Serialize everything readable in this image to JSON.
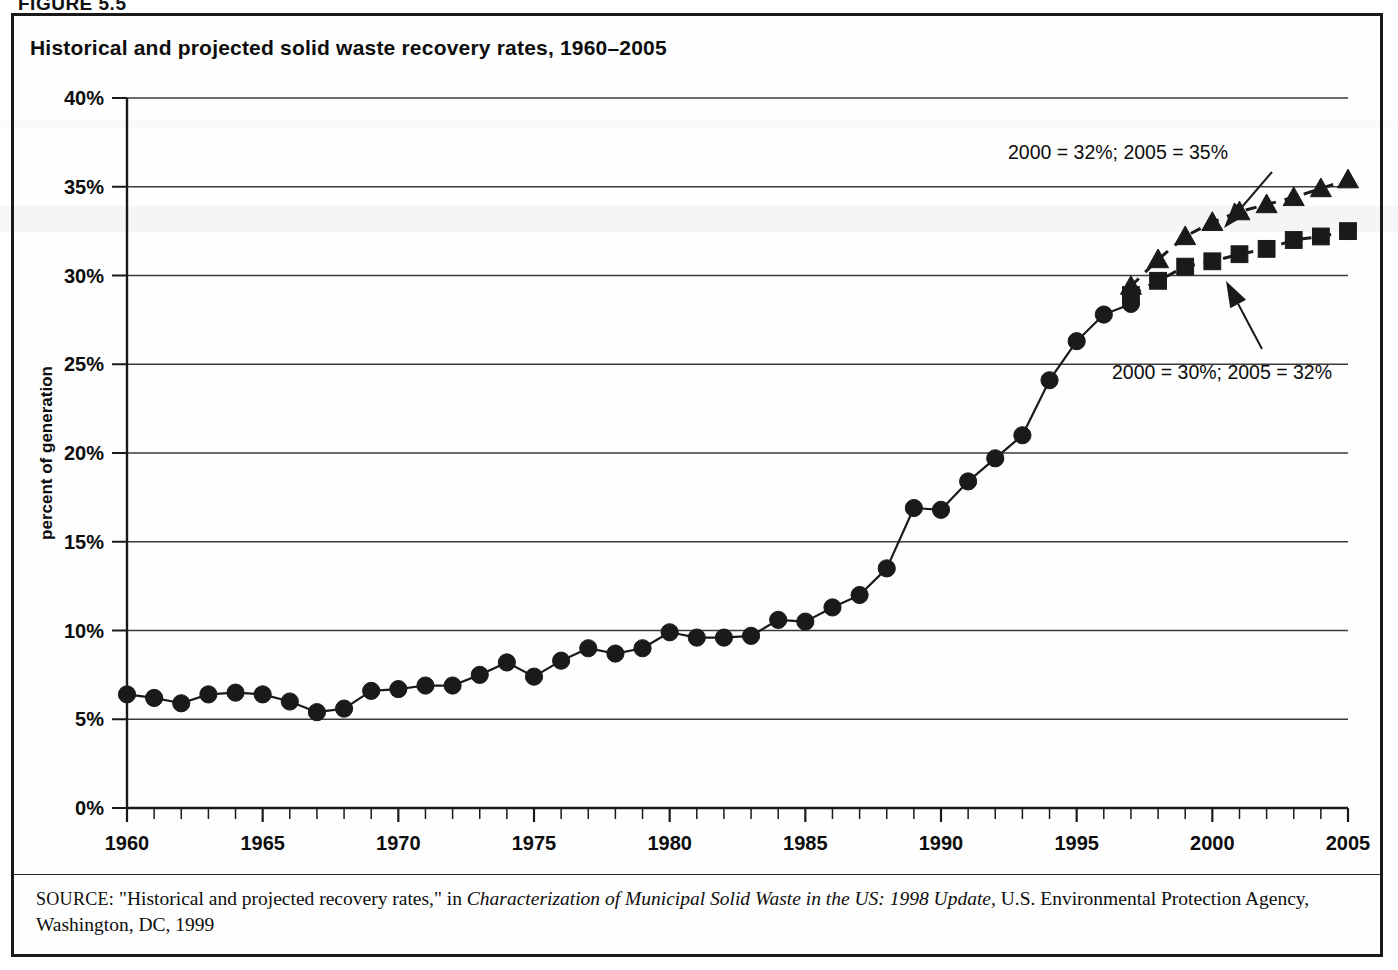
{
  "figure": {
    "label": "FIGURE 5.5",
    "title": "Historical and projected solid waste recovery rates, 1960–2005"
  },
  "source": {
    "kicker": "SOURCE:",
    "text_before_italic": " \"Historical and projected recovery rates,\" in ",
    "italic_title": "Characterization of Municipal Solid Waste in the US: 1998 Update,",
    "text_after_italic": " U.S. Environmental Protection Agency, Washington, DC, 1999"
  },
  "annotations": [
    {
      "name": "projection-high-label",
      "text": "2000 = 32%; 2005 = 35%",
      "x": 1118,
      "y": 159
    },
    {
      "name": "projection-low-label",
      "text": "2000 = 30%; 2005 = 32%",
      "x": 1222,
      "y": 379
    }
  ],
  "chart_data": {
    "type": "line",
    "title": "Historical and projected solid waste recovery rates, 1960–2005",
    "xlabel": "",
    "ylabel": "percent of generation",
    "xlim": [
      1960,
      2005
    ],
    "ylim": [
      0,
      40
    ],
    "ytick_values": [
      0,
      5,
      10,
      15,
      20,
      25,
      30,
      35,
      40
    ],
    "ytick_labels": [
      "0%",
      "5%",
      "10%",
      "15%",
      "20%",
      "25%",
      "30%",
      "35%",
      "40%"
    ],
    "xtick_values": [
      1960,
      1965,
      1970,
      1975,
      1980,
      1985,
      1990,
      1995,
      2000,
      2005
    ],
    "xtick_labels": [
      "1960",
      "1965",
      "1970",
      "1975",
      "1980",
      "1985",
      "1990",
      "1995",
      "2000",
      "2005"
    ],
    "x_minor_tick_step": 1,
    "grid": "horizontal",
    "legend_position": "none",
    "series": [
      {
        "name": "Historical recovery rate",
        "marker": "circle",
        "linestyle": "solid",
        "color": "#1a1a1a",
        "x": [
          1960,
          1961,
          1962,
          1963,
          1964,
          1965,
          1966,
          1967,
          1968,
          1969,
          1970,
          1971,
          1972,
          1973,
          1974,
          1975,
          1976,
          1977,
          1978,
          1979,
          1980,
          1981,
          1982,
          1983,
          1984,
          1985,
          1986,
          1987,
          1988,
          1989,
          1990,
          1991,
          1992,
          1993,
          1994,
          1995,
          1996,
          1997
        ],
        "values": [
          6.4,
          6.2,
          5.9,
          6.4,
          6.5,
          6.4,
          6.0,
          5.4,
          5.6,
          6.6,
          6.7,
          6.9,
          6.9,
          7.5,
          8.2,
          7.4,
          8.3,
          9.0,
          8.7,
          9.0,
          9.9,
          9.6,
          9.6,
          9.7,
          10.6,
          10.5,
          11.3,
          12.0,
          13.5,
          16.9,
          16.8,
          18.4,
          19.7,
          21.0,
          24.1,
          26.3,
          27.8,
          28.4
        ]
      },
      {
        "name": "Projected high scenario",
        "marker": "triangle",
        "linestyle": "dashed",
        "color": "#1a1a1a",
        "x": [
          1997,
          1998,
          1999,
          2000,
          2001,
          2002,
          2003,
          2004,
          2005
        ],
        "values": [
          29.4,
          30.9,
          32.2,
          33.0,
          33.6,
          34.0,
          34.4,
          34.9,
          35.4
        ]
      },
      {
        "name": "Projected low scenario",
        "marker": "square",
        "linestyle": "dashed",
        "color": "#1a1a1a",
        "x": [
          1997,
          1998,
          1999,
          2000,
          2001,
          2002,
          2003,
          2004,
          2005
        ],
        "values": [
          28.9,
          29.7,
          30.5,
          30.8,
          31.2,
          31.5,
          32.0,
          32.2,
          32.5
        ]
      }
    ],
    "annotation_points": [
      {
        "label": "2000 = 32%; 2005 = 35%",
        "target_x": 2001,
        "target_y": 33.2
      },
      {
        "label": "2000 = 30%; 2005 = 32%",
        "target_x": 2001.5,
        "target_y": 31.0
      }
    ]
  }
}
